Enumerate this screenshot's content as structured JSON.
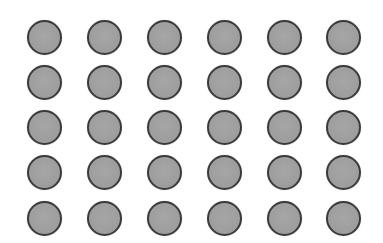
{
  "canvas": {
    "width": 383,
    "height": 243,
    "background": "#ffffff"
  },
  "grid": {
    "rows": 5,
    "cols": 6,
    "col_centers": [
      44,
      104,
      164,
      224,
      284,
      343
    ],
    "row_centers": [
      37,
      82,
      127,
      172,
      218
    ],
    "diameter": 35,
    "fill_color": "#9e9e9e",
    "border_color": "#3a3a3a",
    "border_width": 2.5
  },
  "items": [
    {
      "row": 0,
      "col": 0
    },
    {
      "row": 0,
      "col": 1
    },
    {
      "row": 0,
      "col": 2
    },
    {
      "row": 0,
      "col": 3
    },
    {
      "row": 0,
      "col": 4
    },
    {
      "row": 0,
      "col": 5
    },
    {
      "row": 1,
      "col": 0
    },
    {
      "row": 1,
      "col": 1
    },
    {
      "row": 1,
      "col": 2
    },
    {
      "row": 1,
      "col": 3
    },
    {
      "row": 1,
      "col": 4
    },
    {
      "row": 1,
      "col": 5
    },
    {
      "row": 2,
      "col": 0
    },
    {
      "row": 2,
      "col": 1
    },
    {
      "row": 2,
      "col": 2
    },
    {
      "row": 2,
      "col": 3
    },
    {
      "row": 2,
      "col": 4
    },
    {
      "row": 2,
      "col": 5
    },
    {
      "row": 3,
      "col": 0
    },
    {
      "row": 3,
      "col": 1
    },
    {
      "row": 3,
      "col": 2
    },
    {
      "row": 3,
      "col": 3
    },
    {
      "row": 3,
      "col": 4
    },
    {
      "row": 3,
      "col": 5
    },
    {
      "row": 4,
      "col": 0
    },
    {
      "row": 4,
      "col": 1
    },
    {
      "row": 4,
      "col": 2
    },
    {
      "row": 4,
      "col": 3
    },
    {
      "row": 4,
      "col": 4
    },
    {
      "row": 4,
      "col": 5
    }
  ]
}
